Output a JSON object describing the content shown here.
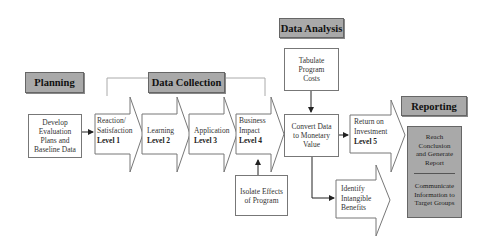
{
  "phases": {
    "planning": "Planning",
    "data_collection": "Data Collection",
    "data_analysis": "Data Analysis",
    "reporting": "Reporting"
  },
  "planning_box": {
    "lines": [
      "Develop",
      "Evaluation",
      "Plans and",
      "Baseline Data"
    ]
  },
  "levels": [
    {
      "lines": [
        "Reaction/",
        "Satisfaction"
      ],
      "level": "Level 1"
    },
    {
      "lines": [
        "Learning"
      ],
      "level": "Level 2"
    },
    {
      "lines": [
        "Application"
      ],
      "level": "Level 3"
    },
    {
      "lines": [
        "Business",
        "Impact"
      ],
      "level": "Level 4"
    },
    {
      "lines": [
        "Return on",
        "Investment"
      ],
      "level": "Level 5"
    }
  ],
  "isolate_box": {
    "lines": [
      "Isolate Effects",
      "of Program"
    ]
  },
  "tabulate_box": {
    "lines": [
      "Tabulate",
      "Program",
      "Costs"
    ]
  },
  "convert_box": {
    "lines": [
      "Convert Data",
      "to Monetary",
      "Value"
    ]
  },
  "intangible": {
    "lines": [
      "Identify",
      "Intangible",
      "Benefits"
    ]
  },
  "report_box": {
    "top_lines": [
      "Reach",
      "Conclusion",
      "and Generate",
      "Report"
    ],
    "bottom_lines": [
      "Communicate",
      "Information to",
      "Target Groups"
    ]
  },
  "colors": {
    "phase_fill": "#a9a9a9",
    "stroke": "#666666",
    "background": "#ffffff"
  }
}
